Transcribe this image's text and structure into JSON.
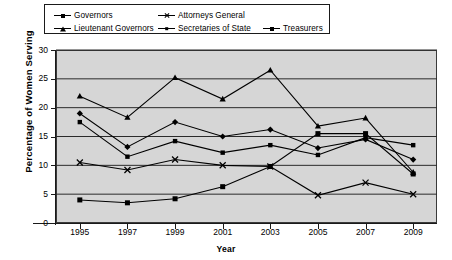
{
  "chart_data": {
    "type": "line",
    "title": "",
    "xlabel": "Year",
    "ylabel": "Percentage of Women Serving",
    "xlim": [
      1994,
      2010
    ],
    "ylim": [
      0,
      30
    ],
    "yticks": [
      0,
      5,
      10,
      15,
      20,
      25,
      30
    ],
    "xticks": [
      1995,
      1997,
      1999,
      2001,
      2003,
      2005,
      2007,
      2009
    ],
    "x": [
      1995,
      1996,
      1997,
      1998,
      1999,
      2000,
      2001,
      2002,
      2003,
      2004,
      2005,
      2006,
      2007,
      2008,
      2009
    ],
    "grid": "horizontal",
    "legend_position": "top",
    "plot_background": "#d6d6d6",
    "line_color": "#000000",
    "series": [
      {
        "name": "Governors",
        "marker": "square",
        "x": [
          1995,
          1997,
          1999,
          2001,
          2003,
          2005,
          2007,
          2009
        ],
        "values": [
          4.0,
          3.5,
          4.2,
          6.3,
          9.8,
          15.5,
          15.5,
          8.5
        ]
      },
      {
        "name": "Lieutenant Governors",
        "marker": "triangle",
        "x": [
          1995,
          1997,
          1999,
          2001,
          2003,
          2005,
          2007,
          2009
        ],
        "values": [
          22.0,
          18.3,
          25.2,
          21.5,
          26.5,
          16.8,
          18.2,
          8.8
        ]
      },
      {
        "name": "Attorneys General",
        "marker": "x",
        "x": [
          1995,
          1997,
          1999,
          2001,
          2003,
          2005,
          2007,
          2009
        ],
        "values": [
          10.5,
          9.2,
          11.0,
          10.0,
          9.8,
          4.8,
          7.0,
          5.0
        ]
      },
      {
        "name": "Secretaries of State",
        "marker": "diamond",
        "x": [
          1995,
          1997,
          1999,
          2001,
          2003,
          2005,
          2007,
          2009
        ],
        "values": [
          19.0,
          13.2,
          17.5,
          15.0,
          16.2,
          13.0,
          14.5,
          11.0
        ]
      },
      {
        "name": "Treasurers",
        "marker": "square-small",
        "x": [
          1995,
          1997,
          1999,
          2001,
          2003,
          2005,
          2007,
          2009
        ],
        "values": [
          17.5,
          11.5,
          14.2,
          12.2,
          13.5,
          11.8,
          14.8,
          13.5
        ]
      }
    ]
  },
  "legend": {
    "entries": [
      {
        "label": "Governors"
      },
      {
        "label": "Attorneys General"
      },
      {
        "label": "Lieutenant Governors"
      },
      {
        "label": "Secretaries of State"
      },
      {
        "label": "Treasurers"
      }
    ]
  },
  "axes": {
    "y_title": "Percentage of Women Serving",
    "x_title": "Year",
    "y_tick_labels": [
      "30",
      "25",
      "20",
      "15",
      "10",
      "5",
      "0"
    ],
    "x_tick_labels": [
      "1995",
      "1997",
      "1999",
      "2001",
      "2003",
      "2005",
      "2007",
      "2009"
    ]
  }
}
